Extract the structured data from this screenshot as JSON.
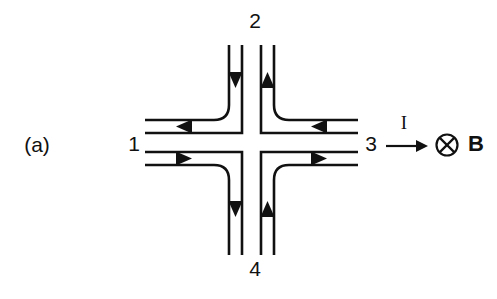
{
  "figure": {
    "panel_label": "(a)",
    "terminals": {
      "left": "1",
      "top": "2",
      "right": "3",
      "bottom": "4"
    },
    "current_symbol": "I",
    "field_symbol": "B",
    "field_direction_icon": "circle-cross-icon",
    "field_direction_meaning": "into-page",
    "colors": {
      "ink": "#111111",
      "background": "#ffffff"
    },
    "flow_arrows": [
      {
        "id": "top-left-channel-inflow",
        "direction": "down"
      },
      {
        "id": "top-right-channel-outflow",
        "direction": "up"
      },
      {
        "id": "left-upper-channel-outflow",
        "direction": "left"
      },
      {
        "id": "left-lower-channel-inflow",
        "direction": "right"
      },
      {
        "id": "right-upper-channel-inflow",
        "direction": "left"
      },
      {
        "id": "right-lower-channel-outflow",
        "direction": "right"
      },
      {
        "id": "bottom-left-channel-outflow",
        "direction": "down"
      },
      {
        "id": "bottom-right-channel-inflow",
        "direction": "up"
      }
    ]
  }
}
